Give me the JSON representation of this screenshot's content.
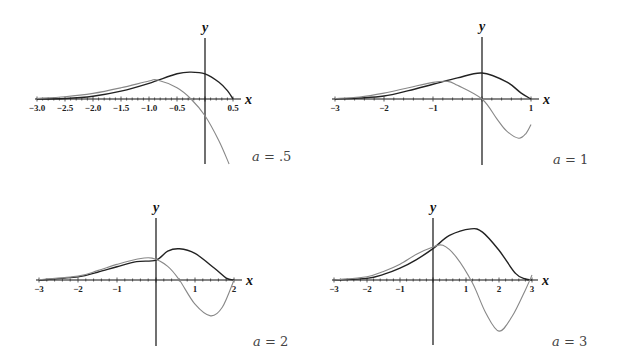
{
  "chart_data": [
    {
      "type": "line",
      "title": "",
      "param_label": "a = .5",
      "xlabel": "x",
      "ylabel": "y",
      "xlim": [
        -3.0,
        0.5
      ],
      "tick_step": 0.1,
      "tick_labels": [
        "-3.0",
        "-2.5",
        "-2.0",
        "-1.5",
        "-1.0",
        "-0.5",
        "0.5"
      ],
      "tick_label_values": [
        -3.0,
        -2.5,
        -2.0,
        -1.5,
        -1.0,
        -0.5,
        0.5
      ],
      "grid": false,
      "legend": "none",
      "layout": {
        "origin_px": [
          205,
          99
        ],
        "unit_px": 56,
        "x0_px": 37,
        "x1_px": 233,
        "yaxis_top_px": 38,
        "yaxis_bottom_px": 164,
        "label_pos": [
          252,
          161
        ]
      },
      "series": [
        {
          "name": "dark curve",
          "color": "#222222",
          "width": 1.4,
          "x": [
            -3,
            -2.5,
            -2,
            -1.5,
            -1,
            -0.5,
            -0.25,
            0,
            0.25,
            0.4,
            0.5
          ],
          "y": [
            0,
            0.01,
            0.05,
            0.14,
            0.28,
            0.45,
            0.48,
            0.45,
            0.3,
            0.15,
            0
          ]
        },
        {
          "name": "light curve",
          "color": "#888888",
          "width": 1.1,
          "x": [
            -3,
            -2.5,
            -2,
            -1.5,
            -1,
            -0.85,
            -0.5,
            -0.25,
            0,
            0.25,
            0.43
          ],
          "y": [
            0.01,
            0.04,
            0.1,
            0.2,
            0.32,
            0.34,
            0.2,
            0,
            -0.3,
            -0.75,
            -1.16
          ]
        }
      ]
    },
    {
      "type": "line",
      "title": "",
      "param_label": "a = 1",
      "xlabel": "x",
      "ylabel": "y",
      "xlim": [
        -3,
        1
      ],
      "tick_step": 0.2,
      "tick_labels": [
        "-3",
        "-2",
        "-1",
        "1"
      ],
      "tick_label_values": [
        -3,
        -2,
        -1,
        1
      ],
      "grid": false,
      "legend": "none",
      "layout": {
        "origin_px": [
          482,
          99
        ],
        "unit_px": 49,
        "x0_px": 334,
        "x1_px": 531,
        "yaxis_top_px": 37,
        "yaxis_bottom_px": 165,
        "label_pos": [
          553,
          164
        ]
      },
      "series": [
        {
          "name": "dark curve",
          "color": "#222222",
          "width": 1.4,
          "x": [
            -3,
            -2.5,
            -2,
            -1.5,
            -1,
            -0.5,
            0,
            0.5,
            0.8,
            1
          ],
          "y": [
            0,
            0.02,
            0.06,
            0.17,
            0.3,
            0.43,
            0.53,
            0.35,
            0.12,
            0
          ]
        },
        {
          "name": "light curve",
          "color": "#888888",
          "width": 1.1,
          "x": [
            -3,
            -2.5,
            -2,
            -1.5,
            -1,
            -0.7,
            -0.5,
            0,
            0.3,
            0.5,
            0.75,
            0.9,
            1
          ],
          "y": [
            0.01,
            0.04,
            0.12,
            0.23,
            0.34,
            0.36,
            0.28,
            0,
            -0.4,
            -0.65,
            -0.8,
            -0.7,
            -0.52
          ]
        }
      ]
    },
    {
      "type": "line",
      "title": "",
      "param_label": "a = 2",
      "xlabel": "x",
      "ylabel": "y",
      "xlim": [
        -3,
        2
      ],
      "tick_step": 0.2,
      "tick_labels": [
        "-3",
        "-2",
        "-1",
        "1",
        "2"
      ],
      "tick_label_values": [
        -3,
        -2,
        -1,
        1,
        2
      ],
      "grid": false,
      "legend": "none",
      "layout": {
        "origin_px": [
          156,
          280
        ],
        "unit_px": 39,
        "x0_px": 38,
        "x1_px": 234,
        "yaxis_top_px": 218,
        "yaxis_bottom_px": 346,
        "label_pos": [
          253,
          346
        ]
      },
      "series": [
        {
          "name": "dark curve",
          "color": "#222222",
          "width": 1.4,
          "x": [
            -3,
            -2,
            -1.5,
            -1,
            -0.5,
            0,
            0.3,
            0.6,
            1,
            1.5,
            1.8,
            2
          ],
          "y": [
            0,
            0.08,
            0.2,
            0.34,
            0.47,
            0.51,
            0.74,
            0.8,
            0.68,
            0.3,
            0.05,
            0
          ]
        },
        {
          "name": "light curve",
          "color": "#888888",
          "width": 1.1,
          "x": [
            -3,
            -2,
            -1.5,
            -1,
            -0.5,
            -0.1,
            0.3,
            0.6,
            1,
            1.4,
            1.7,
            2
          ],
          "y": [
            0.01,
            0.1,
            0.24,
            0.4,
            0.53,
            0.56,
            0.35,
            0,
            -0.62,
            -0.92,
            -0.7,
            0
          ]
        }
      ]
    },
    {
      "type": "line",
      "title": "",
      "param_label": "a = 3",
      "xlabel": "x",
      "ylabel": "y",
      "xlim": [
        -3,
        3
      ],
      "tick_step": 0.2,
      "tick_labels": [
        "-3",
        "-2",
        "-1",
        "1",
        "2",
        "3"
      ],
      "tick_label_values": [
        -3,
        -2,
        -1,
        1,
        2,
        3
      ],
      "grid": false,
      "legend": "none",
      "layout": {
        "origin_px": [
          433,
          280
        ],
        "unit_px": 33,
        "x0_px": 334,
        "x1_px": 530,
        "yaxis_top_px": 218,
        "yaxis_bottom_px": 345,
        "label_pos": [
          552,
          346
        ]
      },
      "series": [
        {
          "name": "dark curve",
          "color": "#222222",
          "width": 1.4,
          "x": [
            -3,
            -2,
            -1.5,
            -1,
            -0.5,
            0,
            0.5,
            1.15,
            1.5,
            2,
            2.5,
            2.8,
            3
          ],
          "y": [
            0,
            0.05,
            0.17,
            0.36,
            0.62,
            0.95,
            1.35,
            1.55,
            1.45,
            0.9,
            0.2,
            0.03,
            0
          ]
        },
        {
          "name": "light curve",
          "color": "#888888",
          "width": 1.1,
          "x": [
            -3,
            -2,
            -1.5,
            -1,
            -0.5,
            0,
            0.3,
            0.7,
            1.2,
            1.6,
            2,
            2.4,
            2.8,
            3
          ],
          "y": [
            0,
            0.1,
            0.26,
            0.48,
            0.78,
            1.0,
            1.05,
            0.7,
            -0.1,
            -1.0,
            -1.55,
            -1.1,
            -0.3,
            0.15
          ]
        }
      ]
    }
  ],
  "axis_names": {
    "x": "x",
    "y": "y"
  }
}
